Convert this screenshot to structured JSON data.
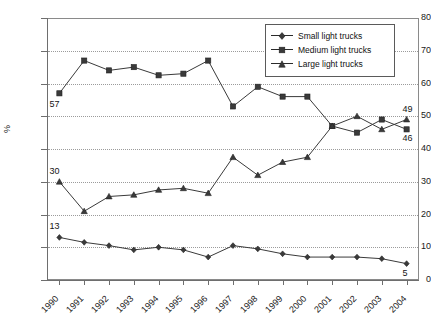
{
  "chart_data": {
    "type": "line",
    "title": "",
    "xlabel": "",
    "ylabel": "%",
    "ylim": [
      0,
      80
    ],
    "ytick_step": 10,
    "yticks": [
      "0",
      "10",
      "20",
      "30",
      "40",
      "50",
      "60",
      "70",
      "80"
    ],
    "grid": true,
    "legend_position": "top-right",
    "categories": [
      "1990",
      "1991",
      "1992",
      "1993",
      "1994",
      "1995",
      "1996",
      "1997",
      "1998",
      "1999",
      "2000",
      "2001",
      "2002",
      "2003",
      "2004"
    ],
    "series": [
      {
        "name": "Small light trucks",
        "marker": "diamond",
        "values": [
          13,
          11.5,
          10.5,
          9.2,
          10,
          9.2,
          7,
          10.5,
          9.5,
          8,
          7,
          7,
          7,
          6.5,
          5
        ]
      },
      {
        "name": "Medium light trucks",
        "marker": "square",
        "values": [
          57,
          67,
          64,
          65,
          62.5,
          63,
          67,
          53,
          59,
          56,
          56,
          47,
          45,
          49,
          46
        ]
      },
      {
        "name": "Large light trucks",
        "marker": "triangle",
        "values": [
          30,
          21,
          25.5,
          26,
          27.5,
          28,
          26.5,
          37.5,
          32,
          36,
          37.5,
          47,
          50,
          46,
          49
        ]
      }
    ],
    "annotations": [
      {
        "text": "57",
        "series": "Medium light trucks",
        "category": "1990"
      },
      {
        "text": "30",
        "series": "Large light trucks",
        "category": "1990"
      },
      {
        "text": "13",
        "series": "Small light trucks",
        "category": "1990"
      },
      {
        "text": "49",
        "series": "Large light trucks",
        "category": "2004"
      },
      {
        "text": "46",
        "series": "Medium light trucks",
        "category": "2004"
      },
      {
        "text": "5",
        "series": "Small light trucks",
        "category": "2004"
      }
    ],
    "colors": {
      "line": "#3a3a3a",
      "marker": "#3a3a3a",
      "grid": "#9b9b9b",
      "axis": "#6e6e6e",
      "text": "#141414"
    }
  },
  "legend": {
    "items": [
      {
        "label": "Small light trucks"
      },
      {
        "label": "Medium light trucks"
      },
      {
        "label": "Large light trucks"
      }
    ]
  }
}
